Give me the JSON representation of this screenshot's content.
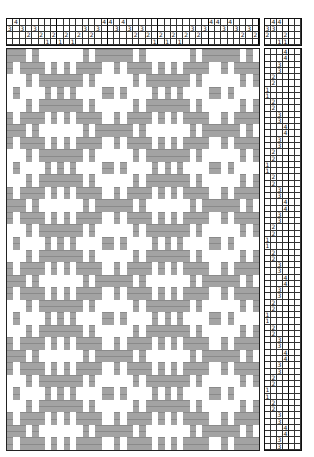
{
  "colors": {
    "weft": "#a3a3a3",
    "warp": "#ffffff",
    "grid": "#333333"
  },
  "threading": {
    "shafts": 4,
    "sequence": [
      3,
      4,
      3,
      2,
      3,
      2,
      1,
      2,
      1,
      2,
      1,
      2,
      3,
      2,
      3,
      4,
      4,
      3,
      4,
      3,
      2,
      3,
      2,
      1,
      2,
      1,
      2,
      1,
      2,
      3,
      2,
      3,
      4,
      4,
      3,
      4,
      3,
      2,
      3,
      2
    ]
  },
  "tieup": {
    "treadles": 6,
    "shafts": 4,
    "numbers": [
      [
        "",
        "4",
        "4",
        "",
        "",
        ""
      ],
      [
        "3",
        "3",
        "",
        "",
        "",
        ""
      ],
      [
        "2",
        "",
        "",
        "2",
        "",
        ""
      ],
      [
        "",
        "",
        "1",
        "1",
        "",
        ""
      ]
    ]
  },
  "treadling": {
    "treadles": 6,
    "sequence": [
      4,
      4,
      3,
      3,
      2,
      2,
      1,
      1,
      2,
      2,
      3,
      3,
      4,
      4,
      3,
      3,
      2,
      2,
      1,
      1,
      2,
      2,
      3,
      3,
      4,
      4,
      3,
      3,
      2,
      2,
      1,
      1,
      2,
      2,
      3,
      3,
      4,
      4,
      3,
      3,
      2,
      2,
      1,
      1,
      2,
      2,
      3,
      3,
      4,
      4,
      3,
      3,
      2,
      2,
      1,
      1,
      2,
      2,
      3,
      3,
      4,
      4,
      3,
      3
    ]
  }
}
